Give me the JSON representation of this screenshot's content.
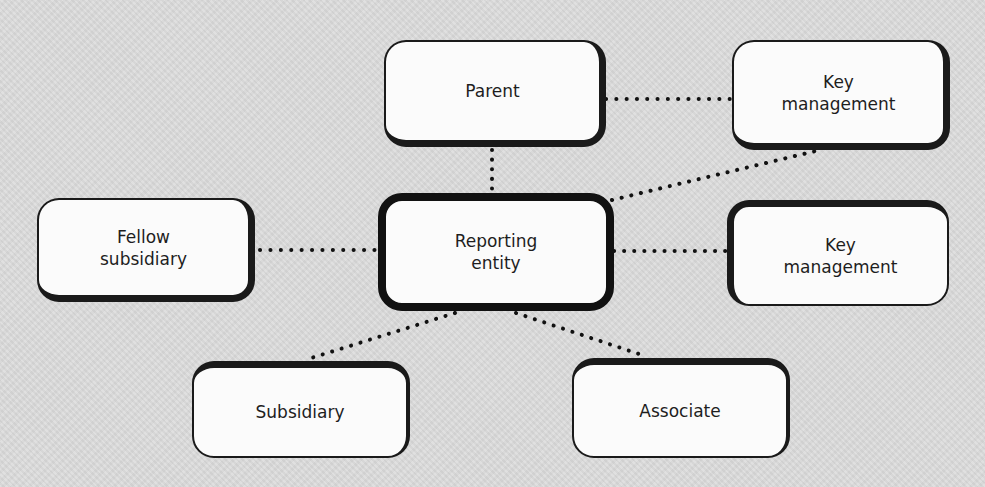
{
  "diagram": {
    "type": "related-parties-relationship-diagram",
    "background_color": "#dcdcdc",
    "box_fill": "#fbfbfb",
    "border_color": "#111111",
    "connector_style": "dotted",
    "nodes": {
      "parent": {
        "label": "Parent"
      },
      "key_management_top": {
        "label": "Key\nmanagement"
      },
      "fellow_subsidiary": {
        "label": "Fellow\nsubsidiary"
      },
      "reporting_entity": {
        "label": "Reporting\nentity"
      },
      "key_management_right": {
        "label": "Key\nmanagement"
      },
      "subsidiary": {
        "label": "Subsidiary"
      },
      "associate": {
        "label": "Associate"
      }
    },
    "edges": [
      {
        "from": "parent",
        "to": "key_management_top"
      },
      {
        "from": "parent",
        "to": "reporting_entity"
      },
      {
        "from": "reporting_entity",
        "to": "key_management_top"
      },
      {
        "from": "fellow_subsidiary",
        "to": "reporting_entity"
      },
      {
        "from": "reporting_entity",
        "to": "key_management_right"
      },
      {
        "from": "reporting_entity",
        "to": "subsidiary"
      },
      {
        "from": "reporting_entity",
        "to": "associate"
      }
    ]
  }
}
